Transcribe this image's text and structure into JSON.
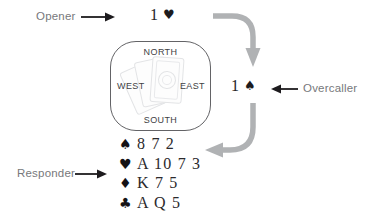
{
  "diagram": {
    "labels": {
      "opener": "Opener",
      "overcaller": "Overcaller",
      "responder": "Responder"
    },
    "bids": {
      "opener": {
        "level": "1",
        "suit": "♥",
        "suit_name": "hearts"
      },
      "overcaller": {
        "level": "1",
        "suit": "♠",
        "suit_name": "spades"
      }
    },
    "compass": {
      "north": "NORTH",
      "east": "EAST",
      "south": "SOUTH",
      "west": "WEST"
    },
    "hand": {
      "rows": [
        {
          "suit": "♠",
          "suit_name": "spades",
          "cards": "8 7 2"
        },
        {
          "suit": "♥",
          "suit_name": "hearts",
          "cards": "A 10 7 3"
        },
        {
          "suit": "♦",
          "suit_name": "diamonds",
          "cards": "K 7 5"
        },
        {
          "suit": "♣",
          "suit_name": "clubs",
          "cards": "A Q 5"
        }
      ]
    },
    "colors": {
      "label_gray": "#77787b",
      "flow_arrow_gray": "#b0b2b4",
      "ink_black": "#1d1b1e"
    }
  }
}
